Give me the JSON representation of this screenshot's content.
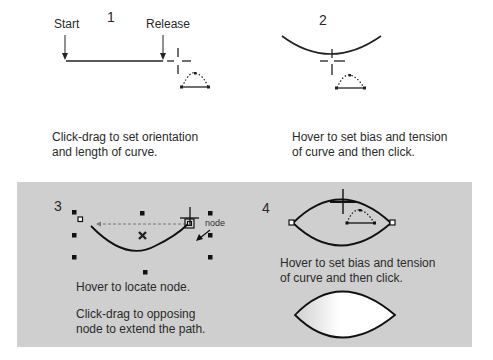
{
  "steps": {
    "s1": {
      "number": "1",
      "start_label": "Start",
      "release_label": "Release",
      "caption_line1": "Click-drag to set orientation",
      "caption_line2": "and length of curve."
    },
    "s2": {
      "number": "2",
      "caption_line1": "Hover to set bias and tension",
      "caption_line2": "of curve and then click."
    },
    "s3": {
      "number": "3",
      "node_label": "node",
      "caption1": "Hover to locate node.",
      "caption2_line1": "Click-drag to opposing",
      "caption2_line2": "node to extend the path."
    },
    "s4": {
      "number": "4",
      "caption_line1": "Hover to set bias and tension",
      "caption_line2": "of curve and then click."
    }
  },
  "colors": {
    "panel_bg": "#cfcfcf",
    "stroke": "#222222"
  }
}
